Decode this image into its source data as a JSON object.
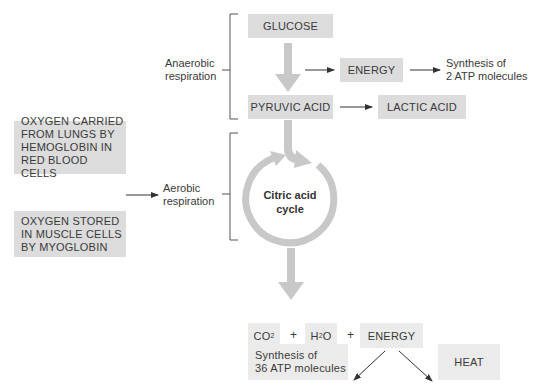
{
  "diagram": {
    "anaerobic": {
      "label_line1": "Anaerobic",
      "label_line2": "respiration",
      "glucose": "GLUCOSE",
      "energy": "ENERGY",
      "synthesis_line1": "Synthesis of",
      "synthesis_line2": "2 ATP molecules",
      "pyruvic_acid": "PYRUVIC ACID",
      "lactic_acid": "LACTIC ACID"
    },
    "oxygen_sources": [
      {
        "line1": "OXYGEN CARRIED",
        "line2": "FROM LUNGS BY",
        "line3": "HEMOGLOBIN IN",
        "line4": "RED BLOOD CELLS"
      },
      {
        "line1": "OXYGEN STORED",
        "line2": "IN MUSCLE CELLS",
        "line3": "BY MYOGLOBIN"
      }
    ],
    "aerobic": {
      "label_line1": "Aerobic",
      "label_line2": "respiration",
      "cycle_line1": "Citric acid",
      "cycle_line2": "cycle"
    },
    "products": {
      "co2_main": "CO",
      "co2_sub": "2",
      "h2o_pre": "H",
      "h2o_sub": "2",
      "h2o_post": "O",
      "plus1": "+",
      "plus2": "+",
      "energy": "ENERGY",
      "synthesis_line1": "Synthesis of",
      "synthesis_line2": "36 ATP molecules",
      "heat": "HEAT"
    },
    "colors": {
      "box_fill": "#dcdcdc",
      "box_fill_light": "#ebebeb",
      "thick_arrow": "#c8c8c8",
      "thin_arrow": "#333333",
      "text": "#3a3a3a"
    }
  }
}
